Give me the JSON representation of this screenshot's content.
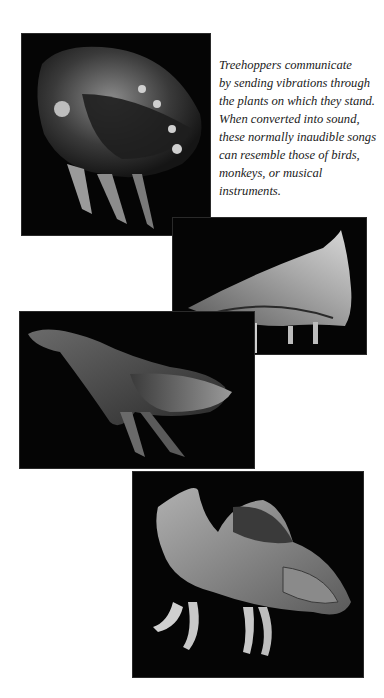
{
  "caption": {
    "lines": [
      "Treehoppers communicate",
      "by sending vibrations through",
      "the plants on which they stand.",
      "When converted into sound,",
      "these normally inaudible songs",
      "can resemble those of birds,",
      "monkeys, or musical",
      "instruments."
    ]
  },
  "photos": [
    {
      "subject": "treehopper-dorsal-view",
      "background": "#050505"
    },
    {
      "subject": "thorn-treehopper-side-view",
      "background": "#050505"
    },
    {
      "subject": "horned-treehopper-side-view",
      "background": "#050505"
    },
    {
      "subject": "crested-treehopper-side-view",
      "background": "#050505"
    }
  ]
}
